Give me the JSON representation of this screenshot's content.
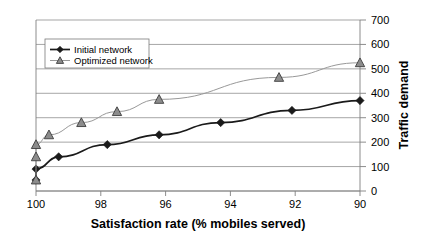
{
  "chart_data": {
    "type": "line",
    "title": "",
    "xlabel": "Satisfaction rate (% mobiles served)",
    "ylabel": "Traffic demand",
    "xlim": [
      100,
      90
    ],
    "ylim": [
      0,
      700
    ],
    "x_ticks": [
      100,
      98,
      96,
      94,
      92,
      90
    ],
    "y_ticks": [
      0,
      100,
      200,
      300,
      400,
      500,
      600,
      700
    ],
    "x_axis_reversed": true,
    "grid": "horizontal",
    "y_axis_position": "right",
    "legend_position": "top-left-inside",
    "series": [
      {
        "name": "Initial network",
        "marker": "diamond",
        "color": "#1a1a1a",
        "x": [
          100.0,
          100.0,
          99.3,
          97.8,
          96.2,
          94.3,
          92.1,
          90.0
        ],
        "values": [
          45,
          90,
          140,
          190,
          230,
          280,
          330,
          370
        ]
      },
      {
        "name": "Optimized network",
        "marker": "triangle",
        "color": "#8c8c8c",
        "x": [
          100.0,
          100.0,
          100.0,
          99.6,
          98.6,
          97.5,
          96.2,
          92.5,
          90.0
        ],
        "values": [
          45,
          140,
          190,
          230,
          280,
          325,
          375,
          465,
          525
        ]
      }
    ]
  },
  "legend": {
    "entries": [
      {
        "label": "Initial network",
        "marker": "diamond-marker"
      },
      {
        "label": "Optimized network",
        "marker": "triangle-marker"
      }
    ]
  },
  "axes": {
    "x_title": "Satisfaction rate (% mobiles served)",
    "y_title": "Traffic demand",
    "x_tick_labels": [
      "100",
      "98",
      "96",
      "94",
      "92",
      "90"
    ],
    "y_tick_labels": [
      "0",
      "100",
      "200",
      "300",
      "400",
      "500",
      "600",
      "700"
    ]
  }
}
